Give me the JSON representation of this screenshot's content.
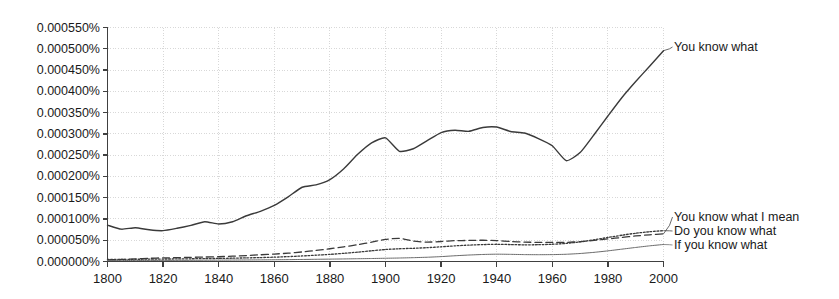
{
  "chart_data": {
    "type": "line",
    "title": "",
    "subtitle": "",
    "xlabel": "",
    "ylabel": "",
    "xlim": [
      1800,
      2000
    ],
    "ylim": [
      0.0,
      0.00055
    ],
    "grid": true,
    "legend_position": "right-inline",
    "x_ticks": [
      1800,
      1820,
      1840,
      1860,
      1880,
      1900,
      1920,
      1940,
      1960,
      1980,
      2000
    ],
    "x_tick_labels": [
      "1800",
      "1820",
      "1840",
      "1860",
      "1880",
      "1900",
      "1920",
      "1940",
      "1960",
      "1980",
      "2000"
    ],
    "y_ticks": [
      0.0,
      5e-05,
      0.0001,
      0.00015,
      0.0002,
      0.00025,
      0.0003,
      0.00035,
      0.0004,
      0.00045,
      0.0005,
      0.00055
    ],
    "y_tick_labels": [
      "0.000000%",
      "0.000050%",
      "0.000100%",
      "0.000150%",
      "0.000200%",
      "0.000250%",
      "0.000300%",
      "0.000350%",
      "0.000400%",
      "0.000450%",
      "0.000500%",
      "0.000550%"
    ],
    "x": [
      1800,
      1805,
      1810,
      1815,
      1820,
      1825,
      1830,
      1835,
      1840,
      1845,
      1850,
      1855,
      1860,
      1865,
      1870,
      1875,
      1880,
      1885,
      1890,
      1895,
      1900,
      1905,
      1910,
      1915,
      1920,
      1925,
      1930,
      1935,
      1940,
      1945,
      1950,
      1955,
      1960,
      1965,
      1970,
      1975,
      1980,
      1985,
      1990,
      1995,
      2000
    ],
    "series": [
      {
        "name": "You know what",
        "style": "solid",
        "color": "#3a3a3a",
        "width": 1.4,
        "values": [
          8.55e-05,
          7.6e-05,
          7.95e-05,
          7.45e-05,
          7.25e-05,
          7.8e-05,
          8.5e-05,
          9.35e-05,
          8.8e-05,
          9.35e-05,
          0.0001075,
          0.000118,
          0.000132,
          0.000152,
          0.0001745,
          0.00018,
          0.0001925,
          0.000218,
          0.000252,
          0.000279,
          0.0002905,
          0.000259,
          0.000265,
          0.000284,
          0.000303,
          0.0003085,
          0.000306,
          0.000315,
          0.000316,
          0.0003055,
          0.000302,
          0.000289,
          0.000272,
          0.000237,
          0.000256,
          0.000298,
          0.000342,
          0.000385,
          0.000423,
          0.000459,
          0.0004955
        ]
      },
      {
        "name": "You know what I mean",
        "style": "dashed",
        "color": "#3a3a3a",
        "width": 1.3,
        "values": [
          3.5e-06,
          4.8e-06,
          6.2e-06,
          7.5e-06,
          8.5e-06,
          9e-06,
          9.8e-06,
          1.05e-05,
          1.12e-05,
          1.25e-05,
          1.4e-05,
          1.58e-05,
          1.75e-05,
          1.95e-05,
          2.25e-05,
          2.6e-05,
          3e-05,
          3.45e-05,
          3.95e-05,
          4.55e-05,
          5.2e-05,
          5.45e-05,
          4.8e-05,
          4.55e-05,
          4.7e-05,
          4.9e-05,
          4.95e-05,
          5e-05,
          4.9e-05,
          4.7e-05,
          4.55e-05,
          4.5e-05,
          4.48e-05,
          4.5e-05,
          4.68e-05,
          4.95e-05,
          5.3e-05,
          5.65e-05,
          6e-05,
          6.28e-05,
          6.5e-05
        ]
      },
      {
        "name": "Do you know what",
        "style": "dotted",
        "color": "#3a3a3a",
        "width": 1.3,
        "values": [
          4.8e-06,
          5e-06,
          5.2e-06,
          5.5e-06,
          5.8e-06,
          6e-06,
          6.4e-06,
          6.8e-06,
          7.2e-06,
          7.8e-06,
          8.5e-06,
          9.2e-06,
          1.02e-05,
          1.15e-05,
          1.3e-05,
          1.48e-05,
          1.68e-05,
          1.92e-05,
          2.2e-05,
          2.52e-05,
          2.82e-05,
          3e-05,
          3.1e-05,
          3.25e-05,
          3.45e-05,
          3.68e-05,
          3.85e-05,
          3.98e-05,
          4.05e-05,
          3.98e-05,
          3.92e-05,
          3.95e-05,
          4.05e-05,
          4.25e-05,
          4.6e-05,
          5.1e-05,
          5.65e-05,
          6.18e-05,
          6.65e-05,
          7e-05,
          7.25e-05
        ]
      },
      {
        "name": "If you know what",
        "style": "solid-thin",
        "color": "#6a6a6a",
        "width": 1.0,
        "values": [
          2.2e-06,
          2.3e-06,
          2.4e-06,
          2.5e-06,
          2.6e-06,
          2.7e-06,
          2.8e-06,
          3e-06,
          3.2e-06,
          3.4e-06,
          3.6e-06,
          3.8e-06,
          4.1e-06,
          4.4e-06,
          4.8e-06,
          5.2e-06,
          5.6e-06,
          6e-06,
          6.5e-06,
          7e-06,
          7.6e-06,
          8.2e-06,
          9e-06,
          1e-05,
          1.15e-05,
          1.35e-05,
          1.52e-05,
          1.65e-05,
          1.72e-05,
          1.68e-05,
          1.62e-05,
          1.6e-05,
          1.62e-05,
          1.7e-05,
          1.88e-05,
          2.15e-05,
          2.5e-05,
          2.9e-05,
          3.3e-05,
          3.68e-05,
          4e-05
        ]
      }
    ],
    "legend_entries": [
      {
        "label": "You know what",
        "value_at_2000": 0.0004955
      },
      {
        "label": "You know what I mean",
        "value_at_2000": 6.5e-05
      },
      {
        "label": "Do you know what",
        "value_at_2000": 7.25e-05
      },
      {
        "label": "If you know what",
        "value_at_2000": 4e-05
      }
    ]
  },
  "axis_colors": {
    "axis_line": "#404040",
    "grid_line": "#d8d8d8",
    "tick_text": "#1a1a1a"
  }
}
